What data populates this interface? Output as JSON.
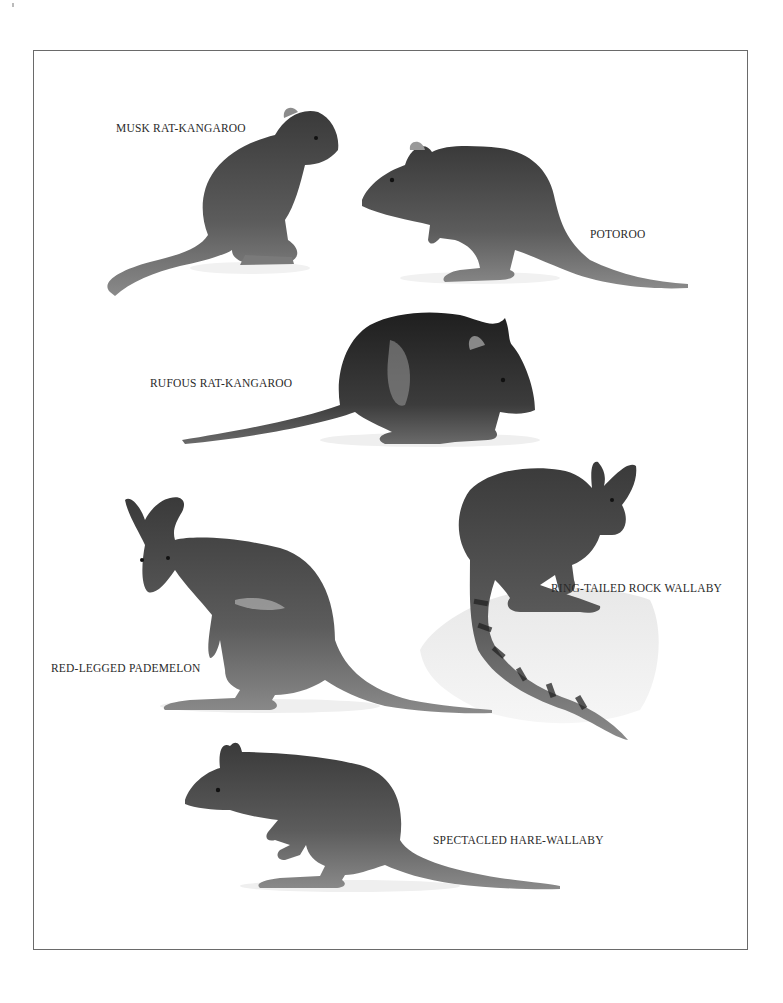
{
  "plate": {
    "border_color": "#6a6a6a",
    "background": "#ffffff"
  },
  "animals": [
    {
      "id": "musk-rat-kangaroo",
      "label": "MUSK RAT-KANGAROO"
    },
    {
      "id": "potoroo",
      "label": "POTOROO"
    },
    {
      "id": "rufous-rat-kangaroo",
      "label": "RUFOUS RAT-KANGAROO"
    },
    {
      "id": "ring-tailed-rock-wallaby",
      "label": "RING-TAILED ROCK WALLABY"
    },
    {
      "id": "red-legged-pademelon",
      "label": "RED-LEGGED PADEMELON"
    },
    {
      "id": "spectacled-hare-wallaby",
      "label": "SPECTACLED HARE-WALLABY"
    }
  ]
}
